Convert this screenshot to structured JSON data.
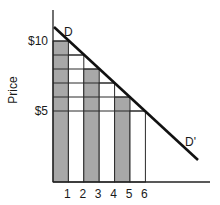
{
  "chart_data": {
    "type": "bar",
    "title": "",
    "xlabel": "",
    "ylabel": "Price",
    "categories": [
      "1",
      "2",
      "3",
      "4",
      "5",
      "6"
    ],
    "values": [
      10,
      9,
      8,
      7,
      6,
      5
    ],
    "bar_shading": [
      "shaded",
      "white",
      "shaded",
      "white",
      "shaded",
      "white"
    ],
    "ytick_labels": [
      "$10",
      "$5"
    ],
    "ytick_values": [
      10,
      5
    ],
    "ylim": [
      0,
      11.2
    ],
    "xlim": [
      0,
      10
    ],
    "demand_line": {
      "label_start": "D",
      "label_end": "D'",
      "points": [
        [
          0,
          10.9
        ],
        [
          9.5,
          1.6
        ]
      ]
    },
    "grid": "horizontal price-step lines at $1 intervals from $5 to $10, bounded by demand line",
    "legend": "none"
  },
  "colors": {
    "shaded": "#a8a8a8",
    "line": "#111111",
    "grid": "#2a2a2a"
  }
}
